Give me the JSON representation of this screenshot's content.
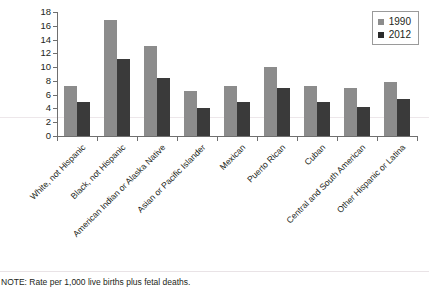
{
  "chart_data": {
    "type": "bar",
    "title": "",
    "xlabel": "",
    "ylabel": "",
    "ylim": [
      0,
      18
    ],
    "ytick_step": 2,
    "yticks": [
      "0",
      "2",
      "4",
      "6",
      "8",
      "10",
      "12",
      "14",
      "16",
      "18"
    ],
    "grid": false,
    "legend_position": "top-right",
    "categories": [
      "White, not Hispanic",
      "Black, not Hispanic",
      "American Indian or Alaska Native",
      "Asian or Pacific Islander",
      "Mexican",
      "Puerto Rican",
      "Cuban",
      "Central and South American",
      "Other Hispanic or Latina"
    ],
    "series": [
      {
        "name": "1990",
        "color": "#8c8c8c",
        "values": [
          7.2,
          16.9,
          13.1,
          6.6,
          7.3,
          10.0,
          7.3,
          7.0,
          7.9
        ]
      },
      {
        "name": "2012",
        "color": "#3a3a3a",
        "values": [
          5.0,
          11.2,
          8.4,
          4.1,
          5.0,
          6.9,
          5.0,
          4.2,
          5.4
        ]
      }
    ],
    "note": "NOTE: Rate per 1,000 live births plus fetal deaths."
  },
  "legend": {
    "items": [
      {
        "label": "1990"
      },
      {
        "label": "2012"
      }
    ]
  },
  "colors": {
    "series_1990": "#8c8c8c",
    "series_2012": "#3a3a3a",
    "axis": "#6f6f6f",
    "text": "#231f20",
    "background": "#ffffff"
  }
}
